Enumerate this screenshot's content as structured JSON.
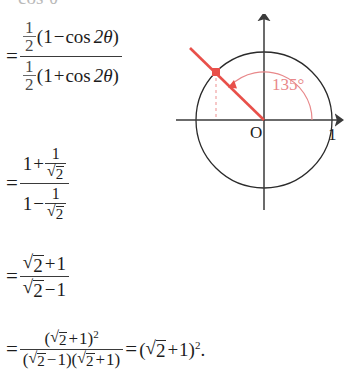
{
  "page": {
    "width": 344,
    "height": 380,
    "background": "#ffffff",
    "ink": "#1c1c1c",
    "accent_red": "#e8504a",
    "accent_red_light": "#e8888a",
    "gray_ink": "#4a4a4a"
  },
  "cut_line": {
    "text": "cos²θ",
    "note": "partially cropped at top edge"
  },
  "steps": [
    {
      "id": "step-1",
      "equals": "=",
      "type": "fraction",
      "numerator": {
        "coefficient_num": "1",
        "coefficient_den": "2",
        "open": "(",
        "left": "1",
        "op": "−",
        "func": "cos",
        "arg": "2θ",
        "close": ")"
      },
      "denominator": {
        "coefficient_num": "1",
        "coefficient_den": "2",
        "open": "(",
        "left": "1",
        "op": "+",
        "func": "cos",
        "arg": "2θ",
        "close": ")"
      }
    },
    {
      "id": "step-2",
      "equals": "=",
      "type": "fraction",
      "numerator": {
        "left": "1",
        "op": "+",
        "frac_num": "1",
        "frac_den_radicand": "2"
      },
      "denominator": {
        "left": "1",
        "op": "−",
        "frac_num": "1",
        "frac_den_radicand": "2"
      }
    },
    {
      "id": "step-3",
      "equals": "=",
      "type": "fraction",
      "numerator": {
        "radicand": "2",
        "op": "+",
        "right": "1"
      },
      "denominator": {
        "radicand": "2",
        "op": "−",
        "right": "1"
      }
    },
    {
      "id": "step-4",
      "equals": "=",
      "type": "fraction-then-result",
      "numerator": {
        "open": "(",
        "radicand": "2",
        "op": "+",
        "right": "1",
        "close": ")",
        "exponent": "2"
      },
      "denominator": {
        "f1_open": "(",
        "f1_radicand": "2",
        "f1_op": "−",
        "f1_right": "1",
        "f1_close": ")",
        "f2_open": "(",
        "f2_radicand": "2",
        "f2_op": "+",
        "f2_right": "1",
        "f2_close": ")"
      },
      "result": {
        "equals": "=",
        "open": "(",
        "radicand": "2",
        "op": "+",
        "right": "1",
        "close": ")",
        "exponent": "2",
        "period": "."
      }
    }
  ],
  "diagram": {
    "type": "unit-circle",
    "origin_label": "O",
    "x_axis_label": "1",
    "angle_label": "135°",
    "angle_degrees": 135,
    "radius_px": 68,
    "center": {
      "x": 88,
      "y": 106
    },
    "terminal_point": {
      "x": -0.7071,
      "y": 0.7071
    },
    "features": [
      "x-axis with right arrowhead",
      "y-axis with up arrowhead",
      "unit circle outline",
      "red terminal ray through 135 degrees extended beyond circle",
      "red square point marker on circle at 135 degrees",
      "red dashed vertical drop line from point to x-axis",
      "red arc indicating the 135 degree angle from positive x-axis"
    ],
    "colors": {
      "circle": "#2a2a2a",
      "axes": "#3a3a3a",
      "ray": "#e8504a",
      "point": "#e8504a",
      "dash": "#ef9a9a",
      "arc": "#e8888a",
      "angle_text": "#e8888a"
    }
  }
}
